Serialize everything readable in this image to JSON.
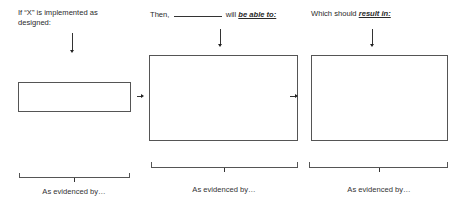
{
  "columns": [
    {
      "prompt_parts": [
        "If “X” is implemented as designed:"
      ],
      "box_label": "",
      "evidence_label": "As evidenced by…"
    },
    {
      "prompt_parts": [
        "Then, ",
        " will ",
        "be able to:"
      ],
      "box_label": "",
      "evidence_label": "As evidenced by…"
    },
    {
      "prompt_parts": [
        "Which should ",
        "result in:"
      ],
      "box_label": "",
      "evidence_label": "As evidenced by…"
    }
  ],
  "icons": {
    "down_arrow": "arrow-down-icon",
    "right_arrow": "arrow-right-icon",
    "bracket": "brace-bracket"
  }
}
